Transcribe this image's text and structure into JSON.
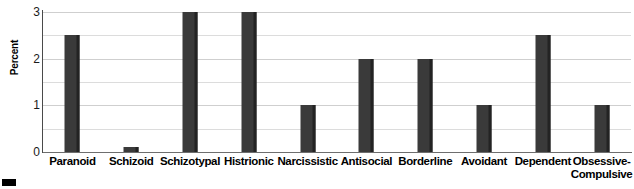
{
  "chart_data": {
    "type": "bar",
    "title": "",
    "xlabel": "",
    "ylabel": "Percent",
    "ylim": [
      0,
      3
    ],
    "yticks": [
      0,
      1,
      2,
      3
    ],
    "ytick_labels": [
      "0",
      "1",
      "2",
      "3"
    ],
    "grid": true,
    "grid_minor_step": 0.5,
    "legend": "none",
    "bar_color": "#3a3a3a",
    "bar_edge_color": "#232323",
    "gridline_color": "#dcdcdc",
    "axis_color": "#4a4a4a",
    "categories": [
      "Paranoid",
      "Schizoid",
      "Schizotypal",
      "Histrionic",
      "Narcissistic",
      "Antisocial",
      "Borderline",
      "Avoidant",
      "Dependent",
      "Obsessive-\nCompulsive"
    ],
    "values": [
      2.5,
      0.1,
      3.0,
      3.0,
      1.0,
      2.0,
      2.0,
      1.0,
      2.5,
      1.0
    ]
  },
  "figure": {
    "caption_marker": "black-square-marker"
  }
}
